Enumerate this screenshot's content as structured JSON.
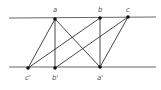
{
  "diagram": {
    "rails": [
      {
        "id": "top",
        "x1": 9,
        "y1": 18,
        "x2": 156,
        "y2": 17
      },
      {
        "id": "bottom",
        "x1": 9,
        "y1": 67,
        "x2": 156,
        "y2": 67
      }
    ],
    "points": [
      {
        "id": "a",
        "label": "a",
        "x": 55,
        "y": 19,
        "lx": 53,
        "ly": 12
      },
      {
        "id": "b",
        "label": "b",
        "x": 100,
        "y": 18,
        "lx": 98,
        "ly": 12
      },
      {
        "id": "c",
        "label": "c",
        "x": 128,
        "y": 17,
        "lx": 126,
        "ly": 12
      },
      {
        "id": "c_prime",
        "label": "c'",
        "x": 28,
        "y": 68,
        "lx": 25,
        "ly": 80
      },
      {
        "id": "b_prime",
        "label": "b'",
        "x": 55,
        "y": 68,
        "lx": 52,
        "ly": 80
      },
      {
        "id": "a_prime",
        "label": "a'",
        "x": 100,
        "y": 67,
        "lx": 97,
        "ly": 80
      }
    ],
    "edges": [
      [
        "a",
        "c_prime"
      ],
      [
        "a",
        "b_prime"
      ],
      [
        "a",
        "a_prime"
      ],
      [
        "b",
        "c_prime"
      ],
      [
        "b",
        "a_prime"
      ],
      [
        "c",
        "b_prime"
      ],
      [
        "c",
        "a_prime"
      ]
    ],
    "colors": {
      "line": "#333333",
      "rail": "#555555",
      "point": "#111111",
      "label": "#555555"
    }
  }
}
